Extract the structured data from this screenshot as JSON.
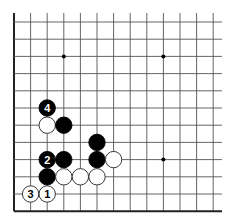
{
  "diagram": {
    "type": "go-board-partial",
    "region": "bottom-left corner",
    "grid": {
      "origin_x": 14,
      "origin_y": 22,
      "spacing_x": 16.6,
      "spacing_y": 17.2,
      "cols": 13,
      "rows": 12,
      "line_extend_right": 222,
      "line_extend_top": 13,
      "edges": [
        "left",
        "bottom"
      ]
    },
    "colors": {
      "line": "#555555",
      "edge": "#222222",
      "black_stone": "#000000",
      "white_stone": "#ffffff",
      "white_stroke": "#222222"
    },
    "hoshi": [
      {
        "col": 3,
        "row": 2
      },
      {
        "col": 9,
        "row": 2
      },
      {
        "col": 9,
        "row": 8
      }
    ],
    "stones": [
      {
        "color": "black",
        "col": 2,
        "row": 5,
        "label": "4"
      },
      {
        "color": "white",
        "col": 2,
        "row": 6,
        "label": ""
      },
      {
        "color": "black",
        "col": 3,
        "row": 6,
        "label": ""
      },
      {
        "color": "black",
        "col": 5,
        "row": 7,
        "label": ""
      },
      {
        "color": "black",
        "col": 2,
        "row": 8,
        "label": "2"
      },
      {
        "color": "black",
        "col": 3,
        "row": 8,
        "label": ""
      },
      {
        "color": "black",
        "col": 5,
        "row": 8,
        "label": ""
      },
      {
        "color": "white",
        "col": 6,
        "row": 8,
        "label": ""
      },
      {
        "color": "black",
        "col": 2,
        "row": 9,
        "label": ""
      },
      {
        "color": "white",
        "col": 3,
        "row": 9,
        "label": ""
      },
      {
        "color": "white",
        "col": 4,
        "row": 9,
        "label": ""
      },
      {
        "color": "white",
        "col": 5,
        "row": 9,
        "label": ""
      },
      {
        "color": "white",
        "col": 1,
        "row": 10,
        "label": "3"
      },
      {
        "color": "white",
        "col": 2,
        "row": 10,
        "label": "1"
      }
    ]
  }
}
